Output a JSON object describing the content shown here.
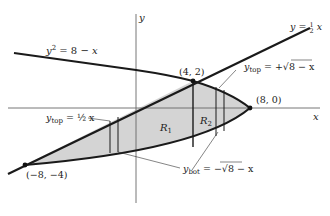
{
  "diagram": {
    "type": "region-between-curves",
    "axes": {
      "x_label": "x",
      "y_label": "y"
    },
    "curves": [
      {
        "id": "parabola",
        "equation": "y² = 8 − x"
      },
      {
        "id": "line",
        "equation": "y = ½ x"
      }
    ],
    "points": [
      {
        "label": "(4, 2)",
        "x": 4,
        "y": 2
      },
      {
        "label": "(8, 0)",
        "x": 8,
        "y": 0
      },
      {
        "label": "(−8, −4)",
        "x": -8,
        "y": -4
      }
    ],
    "regions": [
      {
        "label": "R",
        "sub": "1"
      },
      {
        "label": "R",
        "sub": "2"
      }
    ],
    "annotations": [
      {
        "id": "ytop_line",
        "text": "y",
        "sub": "top",
        "rhs": " = ½ x"
      },
      {
        "id": "ytop_parabola",
        "text": "y",
        "sub": "top",
        "rhs": " = +√8 − x"
      },
      {
        "id": "ybot_parabola",
        "text": "y",
        "sub": "bot",
        "rhs": " = −√8 − x"
      }
    ],
    "colors": {
      "fill": "#d4d4d4",
      "stroke": "#1a1a1a",
      "axis": "#555555"
    }
  }
}
